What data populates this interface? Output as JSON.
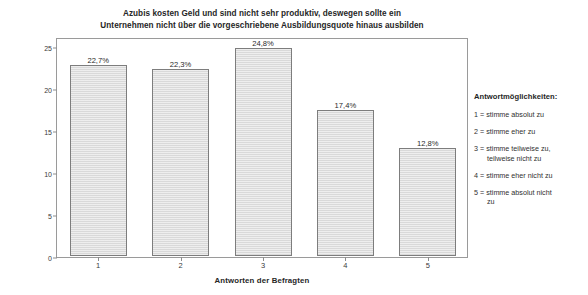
{
  "chart_data": {
    "type": "bar",
    "title": "Azubis kosten Geld und sind nicht sehr produktiv, deswegen sollte ein Unternehmen nicht über die vorgeschriebene Ausbildungsquote hinaus ausbilden",
    "title_lines": [
      "Azubis kosten Geld und sind nicht sehr produktiv, deswegen sollte ein",
      "Unternehmen nicht über die vorgeschriebene Ausbildungsquote hinaus ausbilden"
    ],
    "categories": [
      "1",
      "2",
      "3",
      "4",
      "5"
    ],
    "values": [
      22.7,
      22.3,
      24.8,
      17.4,
      12.8
    ],
    "value_labels": [
      "22,7%",
      "22,3%",
      "24,8%",
      "17,4%",
      "12,8%"
    ],
    "xlabel": "Antworten der Befragten",
    "ylabel": "Prozent",
    "ylim": [
      0,
      25
    ],
    "yticks": [
      0,
      5,
      10,
      15,
      20,
      25
    ],
    "ytick_labels": [
      "0",
      "5",
      "10",
      "15",
      "20",
      "25"
    ],
    "grid": false,
    "legend_position": "right",
    "bar_fill_color": "#d9d9d9",
    "bar_border_color": "#7d7d7d",
    "axis_color": "#9a9a9a"
  },
  "legend": {
    "title": "Antwortmöglichkeiten:",
    "items": [
      {
        "key": "1",
        "text": "1 = stimme absolut zu",
        "lines": [
          "1 = stimme absolut zu"
        ]
      },
      {
        "key": "2",
        "text": "2 = stimme eher zu",
        "lines": [
          "2 = stimme eher zu"
        ]
      },
      {
        "key": "3",
        "text": "3 = stimme teilweise zu, teilweise nicht zu",
        "lines": [
          "3 = stimme teilweise zu,",
          "teilweise nicht zu"
        ]
      },
      {
        "key": "4",
        "text": "4 = stimme eher nicht zu",
        "lines": [
          "4 = stimme eher nicht zu"
        ]
      },
      {
        "key": "5",
        "text": "5 = stimme absolut nicht zu",
        "lines": [
          "5 = stimme absolut nicht",
          "zu"
        ]
      }
    ]
  }
}
